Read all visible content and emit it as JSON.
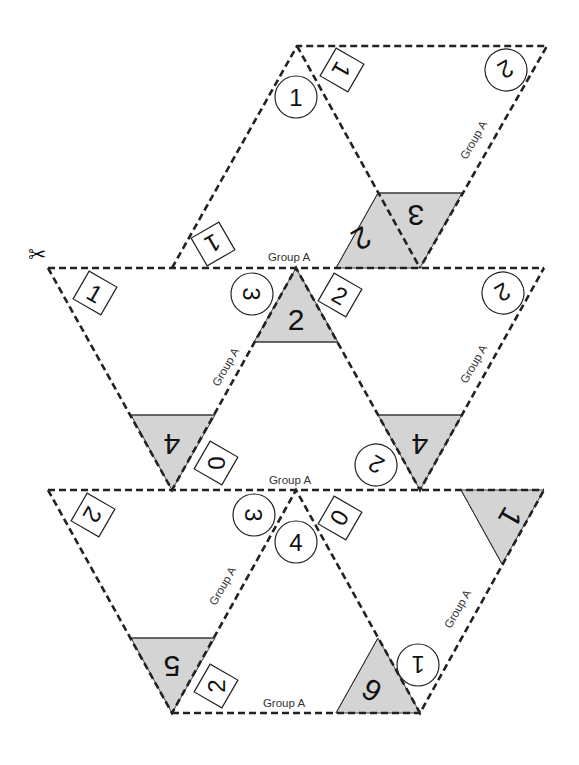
{
  "template": {
    "group_label": "Group A",
    "scissors_icon": "✂"
  },
  "row_top": {
    "circles": [
      "1",
      "2"
    ],
    "boxes": [
      "1",
      "1"
    ],
    "shaded": [
      "2",
      "3"
    ],
    "labels": [
      "Group A",
      "Group A"
    ]
  },
  "row_middle": {
    "circles": [
      "3",
      "2",
      "2"
    ],
    "boxes": [
      "1",
      "2",
      "0"
    ],
    "shaded": [
      "2",
      "4",
      "4"
    ],
    "labels": [
      "Group A",
      "Group A",
      "Group A"
    ]
  },
  "row_bottom": {
    "circles": [
      "3",
      "4",
      "1"
    ],
    "boxes": [
      "2",
      "0",
      "2"
    ],
    "shaded": [
      "1",
      "5",
      "6"
    ],
    "labels": [
      "Group A",
      "Group A",
      "Group A",
      "Group A"
    ]
  },
  "colors": {
    "shade": "#d4d4d4",
    "line": "#222222"
  }
}
